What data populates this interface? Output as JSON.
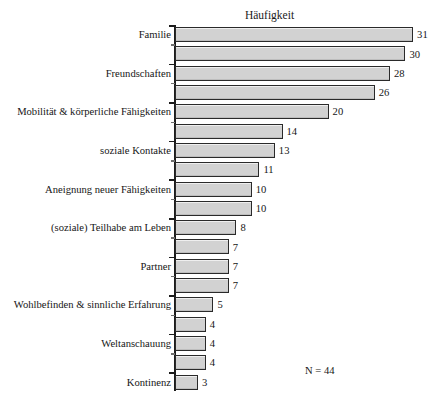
{
  "chart_data": {
    "type": "bar",
    "orientation": "horizontal",
    "title": "Häufigkeit",
    "xlabel": "",
    "ylabel": "",
    "xlim": [
      0,
      31
    ],
    "grid": false,
    "legend": null,
    "annotation": "N = 44",
    "categories": [
      "Familie",
      "",
      "Freundschaften",
      "",
      "Mobilität & körperliche Fähigkeiten",
      "",
      "soziale Kontakte",
      "",
      "Aneignung neuer Fähigkeiten",
      "",
      "(soziale) Teilhabe am Leben",
      "",
      "Partner",
      "",
      "Wohlbefinden & sinnliche Erfahrung",
      "",
      "Weltanschauung",
      "",
      "Kontinenz"
    ],
    "values": [
      31,
      30,
      28,
      26,
      20,
      14,
      13,
      11,
      10,
      10,
      8,
      7,
      7,
      7,
      5,
      4,
      4,
      4,
      3
    ]
  },
  "clipped_header_text": "",
  "colors": {
    "bar_fill": "#d2d2d2",
    "bar_border": "#2a2a2a",
    "axis": "#1c1c1c",
    "text": "#161616",
    "background": "#ffffff"
  }
}
